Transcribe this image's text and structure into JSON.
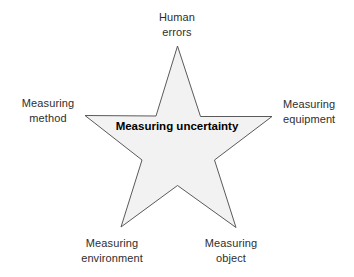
{
  "diagram": {
    "type": "star-concept-diagram",
    "shape": {
      "name": "five-pointed-star",
      "fill_color": "#f2f2f2",
      "stroke_color": "#5a5a5a",
      "stroke_width": 1
    },
    "center_label": {
      "line1": "Measuring",
      "line2": "uncertainty"
    },
    "labels": [
      {
        "id": "human-errors",
        "position": "top",
        "line1": "Human",
        "line2": "errors"
      },
      {
        "id": "measuring-method",
        "position": "left",
        "line1": "Measuring",
        "line2": "method"
      },
      {
        "id": "measuring-equipment",
        "position": "right",
        "line1": "Measuring",
        "line2": "equipment"
      },
      {
        "id": "measuring-environment",
        "position": "bottom-left",
        "line1": "Measuring",
        "line2": "environment"
      },
      {
        "id": "measuring-object",
        "position": "bottom-right",
        "line1": "Measuring",
        "line2": "object"
      }
    ]
  }
}
